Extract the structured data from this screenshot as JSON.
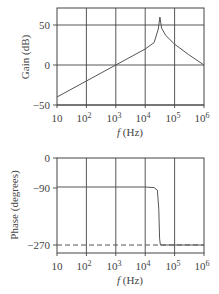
{
  "chart_data": [
    {
      "type": "line",
      "title": "",
      "xlabel": "f (Hz)",
      "ylabel": "Gain (dB)",
      "xscale": "log",
      "xlim": [
        10,
        1000000
      ],
      "ylim": [
        -50,
        71
      ],
      "grid": true,
      "x_tick_labels": [
        "10",
        "10^2",
        "10^3",
        "10^4",
        "10^5",
        "10^6"
      ],
      "y_tick_labels": [
        "50",
        "0",
        "−50"
      ],
      "y_ticks": [
        50,
        0,
        -50
      ],
      "series": [
        {
          "name": "Gain",
          "x": [
            10,
            100,
            1000,
            10000,
            20000,
            28000,
            31600,
            36000,
            50000,
            100000,
            300000,
            1000000
          ],
          "y": [
            -40,
            -20,
            0,
            20,
            28,
            45,
            60,
            46,
            37,
            26,
            13,
            0
          ]
        }
      ]
    },
    {
      "type": "line",
      "title": "",
      "xlabel": "f (Hz)",
      "ylabel": "Phase (degrees)",
      "xscale": "log",
      "xlim": [
        10,
        1000000
      ],
      "ylim": [
        -295,
        0
      ],
      "grid": true,
      "x_tick_labels": [
        "10",
        "10^2",
        "10^3",
        "10^4",
        "10^5",
        "10^6"
      ],
      "y_tick_labels": [
        "0",
        "−90",
        "−270"
      ],
      "y_ticks": [
        0,
        -90,
        -270
      ],
      "series": [
        {
          "name": "Phase",
          "x": [
            10,
            100,
            1000,
            10000,
            20000,
            26000,
            29000,
            31000,
            33000,
            40000,
            100000,
            1000000
          ],
          "y": [
            -90,
            -90,
            -90,
            -90,
            -92,
            -100,
            -160,
            -250,
            -270,
            -270,
            -270,
            -270
          ]
        },
        {
          "name": "−270 reference",
          "style": "dashed",
          "x": [
            10,
            1000000
          ],
          "y": [
            -270,
            -270
          ]
        }
      ]
    }
  ],
  "labels": {
    "gain_ylabel": "Gain (dB)",
    "phase_ylabel": "Phase (degrees)",
    "xlabel_f": "f",
    "xlabel_unit": " (Hz)",
    "gain_ticks": [
      "50",
      "0",
      "−50"
    ],
    "phase_ticks": [
      "0",
      "−90",
      "−270"
    ],
    "x_base": [
      "10",
      "10",
      "10",
      "10",
      "10",
      "10"
    ],
    "x_exp": [
      "",
      "2",
      "3",
      "4",
      "5",
      "6"
    ]
  }
}
